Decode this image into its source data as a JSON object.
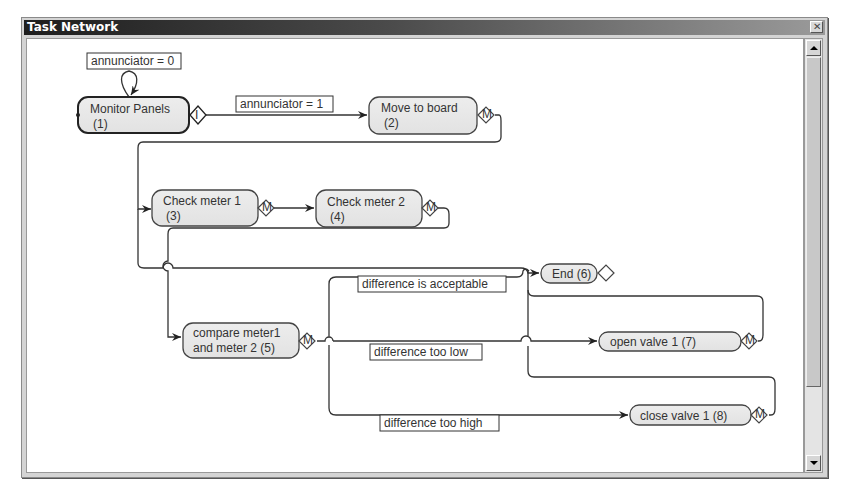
{
  "window": {
    "title": "Task Network",
    "close_label": "✕"
  },
  "nodes": [
    {
      "id": 1,
      "line1": "Monitor Panels",
      "line2": "(1)",
      "badge": "I"
    },
    {
      "id": 2,
      "line1": "Move to board",
      "line2": "(2)",
      "badge": "M"
    },
    {
      "id": 3,
      "line1": "Check meter 1",
      "line2": "(3)",
      "badge": "M"
    },
    {
      "id": 4,
      "line1": "Check meter 2",
      "line2": "(4)",
      "badge": "M"
    },
    {
      "id": 5,
      "line1": "compare meter1",
      "line2": "and meter 2 (5)",
      "badge": "M"
    },
    {
      "id": 6,
      "line1": "End (6)",
      "badge": ""
    },
    {
      "id": 7,
      "line1": "open valve 1 (7)",
      "badge": "M"
    },
    {
      "id": 8,
      "line1": "close valve 1 (8)",
      "badge": "M"
    }
  ],
  "edge_labels": {
    "self_loop": "annunciator = 0",
    "to_move": "annunciator = 1",
    "acceptable": "difference is acceptable",
    "too_low": "difference too low",
    "too_high": "difference too high"
  }
}
